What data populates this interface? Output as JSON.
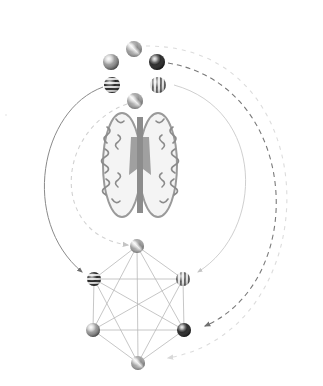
{
  "diagram": {
    "type": "brain-to-network mapping",
    "palette": {
      "background": "#ffffff",
      "edge": "#b8b8b8",
      "arc_solid_dark": "#808080",
      "arc_dashed_dark": "#707070",
      "arc_light": "#cfcfcf",
      "arc_faint": "#dedede",
      "brain_tissue": "#8a8a8a"
    },
    "source_spheres": [
      {
        "id": "s-top",
        "pattern": "swirl",
        "tone": "#8e8e8e",
        "x": 134,
        "y": 49,
        "r": 8
      },
      {
        "id": "s-upper-left",
        "pattern": "plain",
        "tone": "#9a9a9a",
        "x": 111,
        "y": 62,
        "r": 8
      },
      {
        "id": "s-upper-right",
        "pattern": "dark-solid",
        "tone": "#2e2e2e",
        "x": 157,
        "y": 62,
        "r": 8
      },
      {
        "id": "s-lower-left",
        "pattern": "horizontal-stripes",
        "tone": "#3a3a3a",
        "x": 112,
        "y": 85,
        "r": 8
      },
      {
        "id": "s-lower-right",
        "pattern": "vertical-stripes",
        "tone": "#7a7a7a",
        "x": 158,
        "y": 85,
        "r": 8
      },
      {
        "id": "s-bottom",
        "pattern": "swirl",
        "tone": "#a0a0a0",
        "x": 135,
        "y": 101,
        "r": 8
      }
    ],
    "brain": {
      "label": "axial brain slice",
      "cx": 140,
      "cy": 165,
      "w": 74,
      "h": 106
    },
    "network_nodes": [
      {
        "id": "n-top",
        "pattern": "swirl",
        "tone": "#8e8e8e",
        "x": 137,
        "y": 246,
        "r": 7
      },
      {
        "id": "n-upper-left",
        "pattern": "horizontal-stripes",
        "tone": "#3a3a3a",
        "x": 94,
        "y": 279,
        "r": 7
      },
      {
        "id": "n-upper-right",
        "pattern": "vertical-stripes",
        "tone": "#7a7a7a",
        "x": 183,
        "y": 279,
        "r": 7
      },
      {
        "id": "n-lower-left",
        "pattern": "plain",
        "tone": "#9a9a9a",
        "x": 93,
        "y": 330,
        "r": 7
      },
      {
        "id": "n-lower-right",
        "pattern": "dark-solid",
        "tone": "#2e2e2e",
        "x": 184,
        "y": 330,
        "r": 7
      },
      {
        "id": "n-bottom",
        "pattern": "swirl",
        "tone": "#a0a0a0",
        "x": 138,
        "y": 363,
        "r": 7
      }
    ],
    "network_topology": "complete graph K6 (all 15 pairwise edges)",
    "mapping_arcs": [
      {
        "from": "s-lower-left",
        "to": "n-upper-left",
        "style": "solid",
        "tone": "arc_solid_dark",
        "side": "left"
      },
      {
        "from": "s-bottom",
        "to": "n-top",
        "style": "dashed",
        "tone": "arc_light",
        "side": "left"
      },
      {
        "from": "s-lower-right",
        "to": "n-upper-right",
        "style": "solid",
        "tone": "arc_light",
        "side": "right"
      },
      {
        "from": "s-upper-right",
        "to": "n-lower-right",
        "style": "dashed",
        "tone": "arc_dashed_dark",
        "side": "right"
      },
      {
        "from": "s-top",
        "to": "n-bottom",
        "style": "dashed",
        "tone": "arc_faint",
        "side": "right"
      }
    ]
  }
}
